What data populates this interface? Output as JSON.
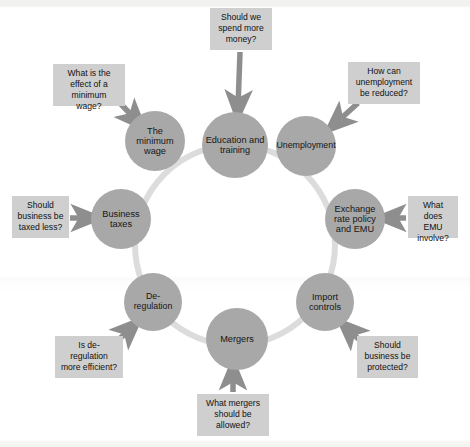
{
  "diagram": {
    "type": "cycle-diagram",
    "ring_color": "#dcdcdc",
    "node_color": "#a8a8a8",
    "box_color": "#cfcfcf",
    "arrow_color": "#8e8e8e",
    "background_color": "#ffffff",
    "ring": {
      "cx": 235,
      "cy": 245,
      "r": 100
    },
    "nodes": [
      {
        "id": "education-and-training",
        "label": "Education and training",
        "lines": [
          "Education",
          "and",
          "training"
        ],
        "cx": 235,
        "cy": 145,
        "r": 33
      },
      {
        "id": "unemployment",
        "label": "Unemployment",
        "lines": [
          "Unemployment"
        ],
        "cx": 306,
        "cy": 146,
        "r": 30
      },
      {
        "id": "exchange-rate-policy-and-emu",
        "label": "Exchange rate policy and EMU",
        "lines": [
          "Exchange",
          "rate policy",
          "and EMU"
        ],
        "cx": 355,
        "cy": 219,
        "r": 30
      },
      {
        "id": "import-controls",
        "label": "Import controls",
        "lines": [
          "Import",
          "controls"
        ],
        "cx": 325,
        "cy": 302,
        "r": 29
      },
      {
        "id": "mergers",
        "label": "Mergers",
        "lines": [
          "Mergers"
        ],
        "cx": 237,
        "cy": 339,
        "r": 31
      },
      {
        "id": "de-regulation",
        "label": "De-regulation",
        "lines": [
          "De-regulation"
        ],
        "cx": 153,
        "cy": 302,
        "r": 29
      },
      {
        "id": "business-taxes",
        "label": "Business taxes",
        "lines": [
          "Business",
          "taxes"
        ],
        "cx": 121,
        "cy": 219,
        "r": 30
      },
      {
        "id": "the-minimum-wage",
        "label": "The minimum wage",
        "lines": [
          "The minimum",
          "wage"
        ],
        "cx": 155,
        "cy": 141,
        "r": 30
      }
    ],
    "questions": [
      {
        "id": "spend-more-money",
        "text": "Should we spend more money?",
        "lines": [
          "Should we",
          "spend more",
          "money?"
        ],
        "target": "education-and-training",
        "x": 210,
        "y": 8,
        "w": 62,
        "h": 42
      },
      {
        "id": "effect-of-minimum-wage",
        "text": "What is the effect of a minimum wage?",
        "lines": [
          "What is the",
          "effect of a",
          "minimum wage?"
        ],
        "target": "the-minimum-wage",
        "x": 53,
        "y": 64,
        "w": 72,
        "h": 42
      },
      {
        "id": "reduce-unemployment",
        "text": "How can unemployment be reduced?",
        "lines": [
          "How can",
          "unemployment",
          "be reduced?"
        ],
        "target": "unemployment",
        "x": 348,
        "y": 62,
        "w": 72,
        "h": 42
      },
      {
        "id": "emu-involve",
        "text": "What does EMU involve?",
        "lines": [
          "What",
          "does EMU",
          "involve?"
        ],
        "target": "exchange-rate-policy-and-emu",
        "x": 408,
        "y": 196,
        "w": 50,
        "h": 42
      },
      {
        "id": "business-protected",
        "text": "Should business be protected?",
        "lines": [
          "Should",
          "business be",
          "protected?"
        ],
        "target": "import-controls",
        "x": 357,
        "y": 336,
        "w": 61,
        "h": 42
      },
      {
        "id": "mergers-allowed",
        "text": "What mergers should be allowed?",
        "lines": [
          "What",
          "mergers should",
          "be allowed?"
        ],
        "target": "mergers",
        "x": 197,
        "y": 394,
        "w": 72,
        "h": 42
      },
      {
        "id": "de-regulation-efficient",
        "text": "Is de-regulation more efficient?",
        "lines": [
          "Is de-regulation",
          "more",
          "efficient?"
        ],
        "target": "de-regulation",
        "x": 55,
        "y": 336,
        "w": 68,
        "h": 42
      },
      {
        "id": "business-taxed-less",
        "text": "Should business be taxed less?",
        "lines": [
          "Should",
          "business be",
          "taxed less?"
        ],
        "target": "business-taxes",
        "x": 12,
        "y": 196,
        "w": 57,
        "h": 42
      }
    ]
  }
}
